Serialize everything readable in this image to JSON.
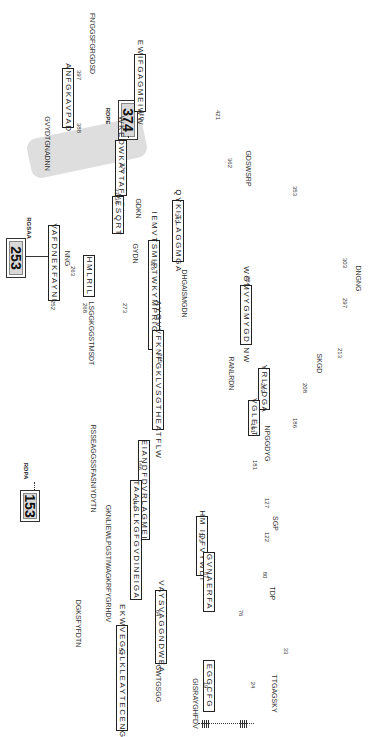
{
  "figure": {
    "type": "protein topology diagram (rotated 90 degrees)",
    "strands": [
      {
        "id": "s1",
        "start": 19,
        "end": 24,
        "seq": "EGGCFG"
      },
      {
        "id": "s2",
        "start": 53,
        "end": 33,
        "seq": "EKWVEGGLKLEAYTECENGLR"
      },
      {
        "id": "s3",
        "start": 64,
        "end": 76,
        "seq": "VAYSVAGGNDWEA"
      },
      {
        "id": "s4",
        "start": 87,
        "end": 80,
        "seq": "GVNAERFA"
      },
      {
        "id": "s5",
        "start": 113,
        "end": 122,
        "seq": "HM IDFVYWDI"
      },
      {
        "id": "s6",
        "start": 144,
        "end": 127,
        "seq": "TAALSLKGFGVDINEIGA"
      },
      {
        "id": "s7",
        "start": 166,
        "end": 181,
        "seq": "EIANDFDVRLAGMEI"
      },
      {
        "id": "s8",
        "start": 191,
        "end": 186,
        "seq": "VGLELT"
      },
      {
        "id": "s9",
        "start": 202,
        "end": 208,
        "seq": "YRLVDGA"
      },
      {
        "id": "s10",
        "start": 235,
        "end": 213,
        "seq": "AYGVVFKNFGKLVSGTHEATFLW"
      },
      {
        "id": "s11",
        "start": 252,
        "end": 263,
        "seq": "VAFDNEKFAYNI"
      },
      {
        "id": "s12",
        "start": 268,
        "end": 273,
        "seq": "HMLRIL"
      },
      {
        "id": "s13",
        "start": 284,
        "end": 297,
        "seq": "WGMVYGMYGDINW"
      },
      {
        "id": "s14",
        "start": 326,
        "end": 303,
        "seq": "IEMVTSMIPTWKYMPRIGVTWWKT"
      },
      {
        "id": "s15",
        "start": 331,
        "end": 336,
        "seq": "VESQRT"
      },
      {
        "id": "s16",
        "start": 342,
        "end": 353,
        "seq": "QYKITLAGGMGA"
      },
      {
        "id": "s17",
        "start": 376,
        "end": 362,
        "seq": "WKEDWKAYTAFVRIA"
      },
      {
        "id": "s18",
        "start": 388,
        "end": 397,
        "seq": "ANFGKAVPAD"
      },
      {
        "id": "s19",
        "start": 410,
        "end": 421,
        "seq": "EWIFGAGMEIWW"
      }
    ],
    "callouts": [
      {
        "label": "153",
        "tag": "RDPA"
      },
      {
        "label": "253",
        "tag": "RGSAA"
      },
      {
        "label": "374",
        "tag": "RDPE"
      }
    ],
    "loops": {
      "nterm": "GISRAYGHFDV",
      "nterm2": "GWTGSGG",
      "l24_33": "TTGAGSKY",
      "l53_64": "DGKSFYFDTN",
      "l76_80": "TDP",
      "l87_113": "GKNLIEWLPGSTIWAGKRFYGRHDV",
      "l122_127": "SGP",
      "l144_166": "RSSEAGGSSFASNIYDYTN",
      "l166_top": "LSGGKGGSTMSDT",
      "l181_191": "NPGGDYG",
      "l191_202": "RANLRDN",
      "l208_213": "SKGD",
      "l263_268": "NNG",
      "l273_284": "DHGAISMGDN",
      "l297_303": "DNGNG",
      "l326_331": "GYDN",
      "l336_342": "GDKN",
      "l353_362": "GDSWSRP",
      "l376_388": "GVYDTGNADNN",
      "l397_410": "FN'GGSFGRGDSD"
    },
    "scale_bar": "membrane marker"
  }
}
